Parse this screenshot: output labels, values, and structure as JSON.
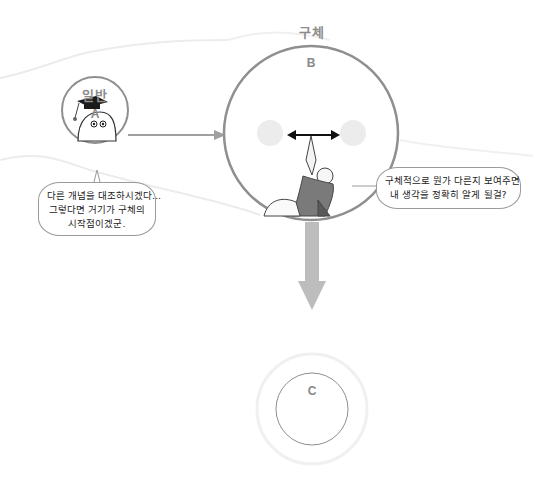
{
  "diagram": {
    "type": "concept-flow",
    "nodes": [
      {
        "id": "A",
        "letter": "A",
        "title": "일반",
        "illustration": "graduate-blob-with-mortarboard"
      },
      {
        "id": "B",
        "letter": "B",
        "title": "구체",
        "illustration": "figure-raising-double-arrow"
      },
      {
        "id": "C",
        "letter": "C",
        "title": ""
      }
    ],
    "edges": [
      {
        "from": "A",
        "to": "B",
        "style": "thin-arrow"
      },
      {
        "from": "B",
        "to": "C",
        "style": "thick-arrow"
      }
    ],
    "bubbles": {
      "a": {
        "lines": [
          "다른 개념을 대조하시겠다...",
          "그렇다면 거기가 구체의",
          "시작점이겠군."
        ]
      },
      "b": {
        "lines": [
          "구체적으로 뭔가 다른지 보여주면",
          "내 생각을 정확히 알게 될걸?"
        ]
      }
    },
    "colors": {
      "circle_stroke": "#9a9a9a",
      "halo": "#eeeeee",
      "arrow": "#a8a8a8",
      "text_label": "#8c8c8c",
      "focus_blob": "#ececec"
    }
  }
}
